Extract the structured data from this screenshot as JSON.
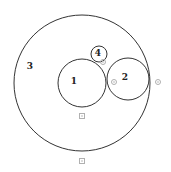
{
  "diagram": {
    "type": "nested-circles",
    "circles": [
      {
        "id": "3",
        "label": "3",
        "cx": 82,
        "cy": 83,
        "r": 68,
        "label_x": 30,
        "label_y": 66
      },
      {
        "id": "1",
        "label": "1",
        "cx": 82,
        "cy": 83,
        "r": 24,
        "label_x": 74,
        "label_y": 81
      },
      {
        "id": "2",
        "label": "2",
        "cx": 128,
        "cy": 79,
        "r": 21,
        "label_x": 125,
        "label_y": 77
      },
      {
        "id": "4",
        "label": "4",
        "cx": 99,
        "cy": 54,
        "r": 8,
        "label_x": 98,
        "label_y": 53
      }
    ],
    "points": [
      {
        "x": 103,
        "y": 62
      },
      {
        "x": 114,
        "y": 82
      },
      {
        "x": 158,
        "y": 82
      },
      {
        "x": 82,
        "y": 116
      },
      {
        "x": 82,
        "y": 161
      }
    ],
    "colors": {
      "stroke": "#333333",
      "label": "#222222",
      "point": "#b0b0b0"
    }
  }
}
